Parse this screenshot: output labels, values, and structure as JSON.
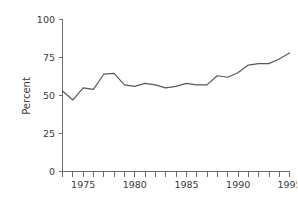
{
  "chart_data": {
    "type": "line",
    "title": "",
    "xlabel": "",
    "ylabel": "Percent",
    "xlim": [
      1972.6,
      1995.4
    ],
    "ylim": [
      0,
      100
    ],
    "grid": false,
    "legend": null,
    "x_tick_labels": [
      "1975",
      "1980",
      "1985",
      "1990",
      "1995"
    ],
    "x_tick_values": [
      1975,
      1980,
      1985,
      1990,
      1995
    ],
    "x_minor_ticks": [
      1973,
      1974,
      1976,
      1977,
      1978,
      1979,
      1981,
      1982,
      1983,
      1984,
      1986,
      1987,
      1988,
      1989,
      1991,
      1992,
      1993,
      1994
    ],
    "y_tick_labels": [
      "0",
      "25",
      "50",
      "75",
      "100"
    ],
    "y_tick_values": [
      0,
      25,
      50,
      75,
      100
    ],
    "line_color": "#585858",
    "axis_color": "#6e6e6e",
    "series": [
      {
        "name": "Percent",
        "x": [
          1973,
          1974,
          1975,
          1976,
          1977,
          1978,
          1979,
          1980,
          1981,
          1982,
          1983,
          1984,
          1985,
          1986,
          1987,
          1988,
          1989,
          1990,
          1991,
          1992,
          1993,
          1994,
          1995
        ],
        "values": [
          53,
          47,
          55,
          54,
          64,
          64.5,
          57,
          56,
          58,
          57,
          55,
          56,
          58,
          57,
          57,
          63,
          62,
          65,
          70,
          71,
          71,
          74,
          78
        ]
      }
    ]
  }
}
